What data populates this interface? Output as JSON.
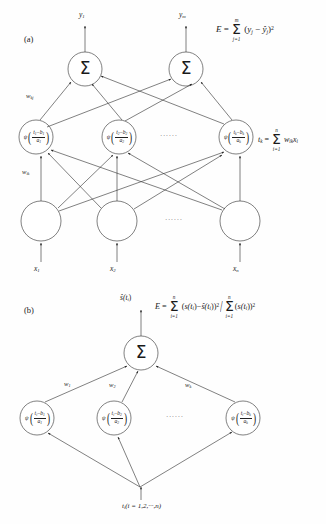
{
  "figure": {
    "background_color": "#fefefe",
    "stroke_color": "#333333",
    "width": 326,
    "height": 524
  },
  "panel_a": {
    "label": "(a)",
    "outputs": [
      {
        "name": "y1",
        "base": "y",
        "sub": "1"
      },
      {
        "name": "ym",
        "base": "y",
        "sub": "m"
      }
    ],
    "output_nodes": [
      {
        "symbol": "Σ"
      },
      {
        "symbol": "Σ"
      }
    ],
    "error_formula": {
      "lhs": "E",
      "equals": "=",
      "sum_symbol": "Σ",
      "sum_upper": "m",
      "sum_lower": "j=1",
      "body_open": "(",
      "term1_base": "y",
      "term1_sub": "j",
      "minus": "−",
      "term2_base": "ŷ",
      "term2_sub": "j",
      "body_close": ")",
      "power": "2"
    },
    "weight_label_output": "w",
    "weight_label_output_sub": "kj",
    "weight_label_input": "w",
    "weight_label_input_sub": "ik",
    "hidden_nodes": [
      {
        "psi": "ψ",
        "num_var": "t",
        "num_sub": "1",
        "minus": "−",
        "num_b": "b",
        "num_b_sub": "1",
        "den": "a",
        "den_sub": "1"
      },
      {
        "psi": "ψ",
        "num_var": "t",
        "num_sub": "2",
        "minus": "−",
        "num_b": "b",
        "num_b_sub": "2",
        "den": "a",
        "den_sub": "2"
      },
      {
        "psi": "ψ",
        "num_var": "t",
        "num_sub": "k",
        "minus": "−",
        "num_b": "b",
        "num_b_sub": "k",
        "den": "a",
        "den_sub": "k"
      }
    ],
    "hidden_ellipsis": "······",
    "tk_formula": {
      "lhs_base": "t",
      "lhs_sub": "k",
      "equals": "=",
      "sum_symbol": "Σ",
      "sum_upper": "n",
      "sum_lower": "i=1",
      "w_base": "w",
      "w_sub": "ik",
      "x_base": "x",
      "x_sub": "i"
    },
    "input_ellipsis": "······",
    "inputs": [
      {
        "base": "x",
        "sub": "1"
      },
      {
        "base": "x",
        "sub": "2"
      },
      {
        "base": "x",
        "sub": "n"
      }
    ]
  },
  "panel_b": {
    "label": "(b)",
    "output": {
      "base": "ŝ",
      "args": "(t",
      "args_sub": "i",
      "args_close": ")"
    },
    "output_node": {
      "symbol": "Σ"
    },
    "error_formula": {
      "lhs": "E",
      "equals": "=",
      "num_sum_symbol": "Σ",
      "num_sum_upper": "n",
      "num_sum_lower": "i=1",
      "num_open": "(",
      "num_term1": "s(t",
      "num_term1_sub": "i",
      "num_term1_close": ")",
      "num_minus": "−",
      "num_term2": "ŝ(t",
      "num_term2_sub": "i",
      "num_term2_close": ")",
      "num_close": ")",
      "num_power": "2",
      "divider": "/",
      "den_sum_symbol": "Σ",
      "den_sum_upper": "n",
      "den_sum_lower": "i=1",
      "den_open": "(",
      "den_term": "s(t",
      "den_term_sub": "i",
      "den_term_close": ")",
      "den_close": ")",
      "den_power": "2"
    },
    "weights": [
      {
        "base": "w",
        "sub": "1"
      },
      {
        "base": "w",
        "sub": "2"
      },
      {
        "base": "w",
        "sub": "k"
      }
    ],
    "hidden_nodes": [
      {
        "psi": "ψ",
        "num_var": "t",
        "num_sub": "i",
        "minus": "−",
        "num_b": "b",
        "num_b_sub": "1",
        "den": "a",
        "den_sub": "1"
      },
      {
        "psi": "ψ",
        "num_var": "t",
        "num_sub": "i",
        "minus": "−",
        "num_b": "b",
        "num_b_sub": "2",
        "den": "a",
        "den_sub": "2"
      },
      {
        "psi": "ψ",
        "num_var": "t",
        "num_sub": "i",
        "minus": "−",
        "num_b": "b",
        "num_b_sub": "k",
        "den": "a",
        "den_sub": "k"
      }
    ],
    "hidden_ellipsis": "······",
    "input_label": {
      "base": "t",
      "sub": "i",
      "rest": "(i = 1,2,···,n)"
    }
  }
}
